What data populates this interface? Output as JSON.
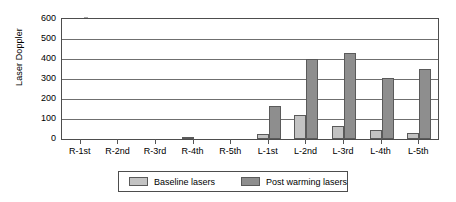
{
  "chart_data": {
    "type": "bar",
    "title": "",
    "xlabel": "",
    "ylabel": "Laser Doppler",
    "ylim": [
      0,
      600
    ],
    "ytick_step": 100,
    "yticks": [
      0,
      100,
      200,
      300,
      400,
      500,
      600
    ],
    "grid": true,
    "legend_position": "bottom",
    "categories": [
      "R-1st",
      "R-2nd",
      "R-3rd",
      "R-4th",
      "R-5th",
      "L-1st",
      "L-2nd",
      "L-3rd",
      "L-4th",
      "L-5th"
    ],
    "series": [
      {
        "name": "Baseline lasers",
        "color": "#c3c3c3",
        "values": [
          0,
          0,
          0,
          5,
          0,
          25,
          120,
          65,
          45,
          28
        ]
      },
      {
        "name": "Post warming lasers",
        "color": "#8e8e8e",
        "values": [
          0,
          0,
          0,
          0,
          0,
          165,
          398,
          430,
          305,
          350
        ]
      }
    ]
  },
  "legend": {
    "items": [
      {
        "label": "Baseline lasers",
        "swatch": "baseline"
      },
      {
        "label": "Post warming lasers",
        "swatch": "post"
      }
    ]
  },
  "axis": {
    "y_title": "Laser Doppler"
  },
  "colors": {
    "baseline": "#c3c3c3",
    "post": "#8e8e8e",
    "axis": "#4d4d4d",
    "grid": "#6f6f6f",
    "text": "#000000",
    "background": "#ffffff"
  }
}
